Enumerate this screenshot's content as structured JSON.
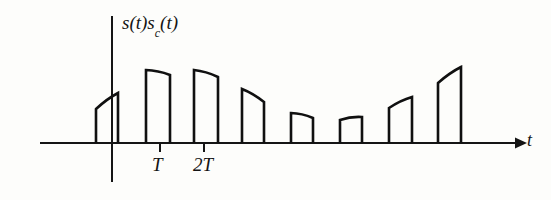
{
  "figure": {
    "title_label": "s(t)s",
    "title_subscript": "c",
    "title_suffix": "(t)",
    "x_axis_label": "t",
    "background_color": "#fdfdfb",
    "line_color": "#101010"
  },
  "axes": {
    "baseline_y": 143,
    "x_start": 40,
    "x_end": 520,
    "vertical_axis_x": 112,
    "vertical_axis_top": 16,
    "vertical_axis_bottom": 182,
    "arrow_label": "t"
  },
  "ticks": [
    {
      "label": "T",
      "x": 160,
      "y": 143,
      "length": 9
    },
    {
      "label": "2T",
      "x": 204,
      "y": 143,
      "length": 9
    }
  ],
  "chart_data": {
    "type": "area",
    "xlabel": "t",
    "ylabel": "s(t)s_c(t)",
    "grid": false,
    "legend": null,
    "baseline": 0,
    "tick_labels": [
      "T",
      "2T"
    ],
    "pulse_width_px": 22,
    "pulses": [
      {
        "index": 0,
        "x_left": 96,
        "x_right": 118,
        "h_left": 34,
        "h_right": 50,
        "shape": "rising"
      },
      {
        "index": 1,
        "x_left": 146,
        "x_right": 170,
        "h_left": 73,
        "h_right": 68,
        "shape": "flat-curved"
      },
      {
        "index": 2,
        "x_left": 194,
        "x_right": 218,
        "h_left": 73,
        "h_right": 66,
        "shape": "flat-curved"
      },
      {
        "index": 3,
        "x_left": 242,
        "x_right": 264,
        "h_left": 54,
        "h_right": 41,
        "shape": "falling"
      },
      {
        "index": 4,
        "x_left": 291,
        "x_right": 313,
        "h_left": 30,
        "h_right": 25,
        "shape": "falling"
      },
      {
        "index": 5,
        "x_left": 340,
        "x_right": 362,
        "h_left": 23,
        "h_right": 26,
        "shape": "flat"
      },
      {
        "index": 6,
        "x_left": 389,
        "x_right": 412,
        "h_left": 35,
        "h_right": 46,
        "shape": "rising"
      },
      {
        "index": 7,
        "x_left": 438,
        "x_right": 461,
        "h_left": 60,
        "h_right": 76,
        "shape": "rising"
      }
    ],
    "ylim": [
      0,
      90
    ],
    "xlim": [
      40,
      520
    ]
  }
}
